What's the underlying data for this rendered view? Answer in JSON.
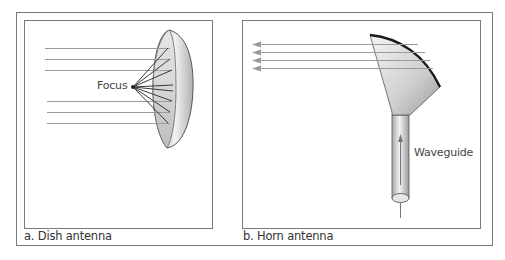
{
  "figure": {
    "panels": [
      {
        "id": "a",
        "caption": "a. Dish antenna",
        "labels": {
          "focus": "Focus"
        }
      },
      {
        "id": "b",
        "caption": "b. Horn antenna",
        "labels": {
          "waveguide": "Waveguide"
        }
      }
    ],
    "colors": {
      "frame": "#7a7a7a",
      "ray": "#9a9a9a",
      "dish_edge": "#555555",
      "horn_rim": "#1a1a1a",
      "text": "#333333"
    }
  }
}
